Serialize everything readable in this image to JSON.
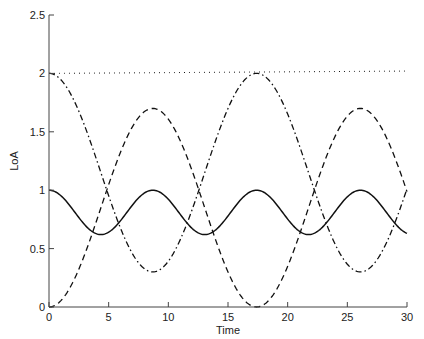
{
  "chart_data": {
    "type": "line",
    "title": "",
    "xlabel": "Time",
    "ylabel": "LoA",
    "xlim": [
      0,
      30
    ],
    "ylim": [
      0,
      2.5
    ],
    "xticks": [
      0,
      5,
      10,
      15,
      20,
      25,
      30
    ],
    "yticks": [
      0,
      0.5,
      1,
      1.5,
      2,
      2.5
    ],
    "xtick_labels": [
      "0",
      "5",
      "10",
      "15",
      "20",
      "25",
      "30"
    ],
    "ytick_labels": [
      "0",
      "0.5",
      "1",
      "1.5",
      "2",
      "2.5"
    ],
    "grid": false,
    "legend": null,
    "series": [
      {
        "name": "solid",
        "style": "solid",
        "description": "Oscillates between 1.0 and ~0.62, period ~8.7",
        "x": [
          0,
          2.2,
          4.35,
          6.5,
          8.7,
          10.9,
          13.05,
          15.2,
          17.4,
          19.6,
          21.75,
          23.9,
          26.1,
          28.3,
          30
        ],
        "values": [
          1.0,
          0.81,
          0.62,
          0.81,
          1.0,
          0.81,
          0.62,
          0.81,
          1.0,
          0.81,
          0.62,
          0.81,
          1.0,
          0.81,
          0.65
        ]
      },
      {
        "name": "dashed",
        "style": "dashed",
        "description": "Oscillates between 0 and ~1.7, period ~17.4",
        "x": [
          0,
          2.2,
          4.35,
          6.5,
          8.7,
          10.9,
          13.05,
          15.2,
          17.4,
          19.6,
          21.75,
          23.9,
          26.1,
          28.3,
          30
        ],
        "values": [
          0.0,
          0.25,
          0.85,
          1.45,
          1.7,
          1.45,
          0.85,
          0.25,
          0.0,
          0.25,
          0.85,
          1.45,
          1.7,
          1.45,
          1.3
        ]
      },
      {
        "name": "dash-dot",
        "style": "dashdot",
        "description": "Oscillates between 2.0 and ~0.3, period ~17.4",
        "x": [
          0,
          2.2,
          4.35,
          6.5,
          8.7,
          10.9,
          13.05,
          15.2,
          17.4,
          19.6,
          21.75,
          23.9,
          26.1,
          28.3,
          30
        ],
        "values": [
          2.0,
          1.75,
          1.15,
          0.55,
          0.3,
          0.55,
          1.15,
          1.75,
          2.0,
          1.75,
          1.15,
          0.55,
          0.3,
          0.55,
          1.1
        ]
      },
      {
        "name": "dotted",
        "style": "dotted",
        "description": "Nearly constant at ~2, rising slightly",
        "x": [
          0,
          30
        ],
        "values": [
          2.0,
          2.02
        ]
      }
    ]
  },
  "plot": {
    "xmin": 0,
    "xmax": 30,
    "ymin": 0,
    "ymax": 2.5,
    "px_left": 49,
    "px_right": 407,
    "px_top": 15,
    "px_bottom": 307,
    "line_color": "#111111",
    "axis_color": "#444444"
  }
}
